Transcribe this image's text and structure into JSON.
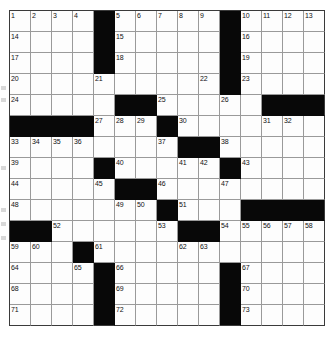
{
  "puzzle": {
    "title": "Crossword Grid",
    "size": {
      "rows": 15,
      "cols": 15
    },
    "colors": {
      "block": "#080808",
      "cell": "#fdfdfd",
      "grid_line": "#9a9a9a",
      "border": "#3a3a3a",
      "number_text": "#111111"
    },
    "cell_px": 21,
    "max_clue_number": 73,
    "layout_note": "standard 15x15 American-style symmetric crossword, empty (unfilled) grid",
    "grid": [
      [
        "1",
        "2",
        "3",
        "4",
        "#",
        "5",
        "6",
        "7",
        "8",
        "9",
        "#",
        "10",
        "11",
        "12",
        "13"
      ],
      [
        "14",
        "",
        "",
        "",
        "#",
        "15",
        "",
        "",
        "",
        "",
        "#",
        "16",
        "",
        "",
        ""
      ],
      [
        "17",
        "",
        "",
        "",
        "#",
        "18",
        "",
        "",
        "",
        "",
        "#",
        "19",
        "",
        "",
        ""
      ],
      [
        "20",
        "",
        "",
        "",
        "21",
        "",
        "",
        "",
        "",
        "22",
        "#",
        "23",
        "",
        "",
        ""
      ],
      [
        "24",
        "",
        "",
        "",
        "",
        "#",
        "#",
        "25",
        "",
        "",
        "26",
        "",
        "#",
        "#",
        "#"
      ],
      [
        "#",
        "#",
        "#",
        "#",
        "27",
        "28",
        "29",
        "#",
        "30",
        "",
        "",
        "",
        "31",
        "32",
        ""
      ],
      [
        "33",
        "34",
        "35",
        "36",
        "",
        "",
        "",
        "37",
        "#",
        "#",
        "38",
        "",
        "",
        "",
        ""
      ],
      [
        "39",
        "",
        "",
        "",
        "#",
        "40",
        "",
        "",
        "41",
        "42",
        "#",
        "43",
        "",
        "",
        ""
      ],
      [
        "44",
        "",
        "",
        "",
        "45",
        "#",
        "#",
        "46",
        "",
        "",
        "47",
        "",
        "",
        "",
        ""
      ],
      [
        "48",
        "",
        "",
        "",
        "",
        "49",
        "50",
        "#",
        "51",
        "",
        "",
        "#",
        "#",
        "#",
        "#"
      ],
      [
        "#",
        "#",
        "52",
        "",
        "",
        "",
        "",
        "53",
        "#",
        "#",
        "54",
        "55",
        "56",
        "57",
        "58"
      ],
      [
        "59",
        "60",
        "",
        "#",
        "61",
        "",
        "",
        "",
        "62",
        "63",
        "",
        "",
        "",
        "",
        ""
      ],
      [
        "64",
        "",
        "",
        "65",
        "#",
        "66",
        "",
        "",
        "",
        "",
        "#",
        "67",
        "",
        "",
        ""
      ],
      [
        "68",
        "",
        "",
        "",
        "#",
        "69",
        "",
        "",
        "",
        "",
        "#",
        "70",
        "",
        "",
        ""
      ],
      [
        "71",
        "",
        "",
        "",
        "#",
        "72",
        "",
        "",
        "",
        "",
        "#",
        "73",
        "",
        "",
        ""
      ]
    ],
    "numbered_cells": [
      {
        "n": 1,
        "r": 0,
        "c": 0
      },
      {
        "n": 2,
        "r": 0,
        "c": 1
      },
      {
        "n": 3,
        "r": 0,
        "c": 2
      },
      {
        "n": 4,
        "r": 0,
        "c": 3
      },
      {
        "n": 5,
        "r": 0,
        "c": 5
      },
      {
        "n": 6,
        "r": 0,
        "c": 6
      },
      {
        "n": 7,
        "r": 0,
        "c": 7
      },
      {
        "n": 8,
        "r": 0,
        "c": 8
      },
      {
        "n": 9,
        "r": 0,
        "c": 9
      },
      {
        "n": 10,
        "r": 0,
        "c": 11
      },
      {
        "n": 11,
        "r": 0,
        "c": 12
      },
      {
        "n": 12,
        "r": 0,
        "c": 13
      },
      {
        "n": 13,
        "r": 0,
        "c": 14
      },
      {
        "n": 14,
        "r": 1,
        "c": 0
      },
      {
        "n": 15,
        "r": 1,
        "c": 5
      },
      {
        "n": 16,
        "r": 1,
        "c": 11
      },
      {
        "n": 17,
        "r": 2,
        "c": 0
      },
      {
        "n": 18,
        "r": 2,
        "c": 5
      },
      {
        "n": 19,
        "r": 2,
        "c": 11
      },
      {
        "n": 20,
        "r": 3,
        "c": 0
      },
      {
        "n": 21,
        "r": 3,
        "c": 4
      },
      {
        "n": 22,
        "r": 3,
        "c": 9
      },
      {
        "n": 23,
        "r": 3,
        "c": 11
      },
      {
        "n": 24,
        "r": 4,
        "c": 0
      },
      {
        "n": 25,
        "r": 4,
        "c": 7
      },
      {
        "n": 26,
        "r": 4,
        "c": 10
      },
      {
        "n": 27,
        "r": 5,
        "c": 4
      },
      {
        "n": 28,
        "r": 5,
        "c": 5
      },
      {
        "n": 29,
        "r": 5,
        "c": 6
      },
      {
        "n": 30,
        "r": 5,
        "c": 8
      },
      {
        "n": 31,
        "r": 5,
        "c": 12
      },
      {
        "n": 32,
        "r": 5,
        "c": 13
      },
      {
        "n": 33,
        "r": 6,
        "c": 0
      },
      {
        "n": 34,
        "r": 6,
        "c": 1
      },
      {
        "n": 35,
        "r": 6,
        "c": 2
      },
      {
        "n": 36,
        "r": 6,
        "c": 3
      },
      {
        "n": 37,
        "r": 6,
        "c": 7
      },
      {
        "n": 38,
        "r": 6,
        "c": 10
      },
      {
        "n": 39,
        "r": 7,
        "c": 0
      },
      {
        "n": 40,
        "r": 7,
        "c": 5
      },
      {
        "n": 41,
        "r": 7,
        "c": 8
      },
      {
        "n": 42,
        "r": 7,
        "c": 9
      },
      {
        "n": 43,
        "r": 7,
        "c": 11
      },
      {
        "n": 44,
        "r": 8,
        "c": 0
      },
      {
        "n": 45,
        "r": 8,
        "c": 4
      },
      {
        "n": 46,
        "r": 8,
        "c": 7
      },
      {
        "n": 47,
        "r": 8,
        "c": 10
      },
      {
        "n": 48,
        "r": 9,
        "c": 0
      },
      {
        "n": 49,
        "r": 9,
        "c": 5
      },
      {
        "n": 50,
        "r": 9,
        "c": 6
      },
      {
        "n": 51,
        "r": 9,
        "c": 8
      },
      {
        "n": 52,
        "r": 10,
        "c": 2
      },
      {
        "n": 53,
        "r": 10,
        "c": 7
      },
      {
        "n": 54,
        "r": 10,
        "c": 10
      },
      {
        "n": 55,
        "r": 10,
        "c": 11
      },
      {
        "n": 56,
        "r": 10,
        "c": 12
      },
      {
        "n": 57,
        "r": 10,
        "c": 13
      },
      {
        "n": 58,
        "r": 10,
        "c": 14
      },
      {
        "n": 59,
        "r": 11,
        "c": 0
      },
      {
        "n": 60,
        "r": 11,
        "c": 1
      },
      {
        "n": 61,
        "r": 11,
        "c": 4
      },
      {
        "n": 62,
        "r": 11,
        "c": 8
      },
      {
        "n": 63,
        "r": 11,
        "c": 9
      },
      {
        "n": 64,
        "r": 12,
        "c": 0
      },
      {
        "n": 65,
        "r": 12,
        "c": 3
      },
      {
        "n": 66,
        "r": 12,
        "c": 5
      },
      {
        "n": 67,
        "r": 12,
        "c": 11
      },
      {
        "n": 68,
        "r": 13,
        "c": 0
      },
      {
        "n": 69,
        "r": 13,
        "c": 5
      },
      {
        "n": 70,
        "r": 13,
        "c": 11
      },
      {
        "n": 71,
        "r": 14,
        "c": 0
      },
      {
        "n": 72,
        "r": 14,
        "c": 5
      },
      {
        "n": 73,
        "r": 14,
        "c": 11
      }
    ],
    "block_cells": [
      {
        "r": 0,
        "c": 4
      },
      {
        "r": 0,
        "c": 10
      },
      {
        "r": 1,
        "c": 4
      },
      {
        "r": 1,
        "c": 10
      },
      {
        "r": 2,
        "c": 4
      },
      {
        "r": 2,
        "c": 10
      },
      {
        "r": 3,
        "c": 10
      },
      {
        "r": 4,
        "c": 5
      },
      {
        "r": 4,
        "c": 6
      },
      {
        "r": 4,
        "c": 12
      },
      {
        "r": 4,
        "c": 13
      },
      {
        "r": 4,
        "c": 14
      },
      {
        "r": 5,
        "c": 0
      },
      {
        "r": 5,
        "c": 1
      },
      {
        "r": 5,
        "c": 2
      },
      {
        "r": 5,
        "c": 3
      },
      {
        "r": 5,
        "c": 7
      },
      {
        "r": 6,
        "c": 8
      },
      {
        "r": 6,
        "c": 9
      },
      {
        "r": 7,
        "c": 4
      },
      {
        "r": 7,
        "c": 10
      },
      {
        "r": 8,
        "c": 5
      },
      {
        "r": 8,
        "c": 6
      },
      {
        "r": 9,
        "c": 7
      },
      {
        "r": 9,
        "c": 11
      },
      {
        "r": 9,
        "c": 12
      },
      {
        "r": 9,
        "c": 13
      },
      {
        "r": 9,
        "c": 14
      },
      {
        "r": 10,
        "c": 0
      },
      {
        "r": 10,
        "c": 1
      },
      {
        "r": 10,
        "c": 8
      },
      {
        "r": 10,
        "c": 9
      },
      {
        "r": 11,
        "c": 3
      },
      {
        "r": 12,
        "c": 4
      },
      {
        "r": 12,
        "c": 10
      },
      {
        "r": 13,
        "c": 4
      },
      {
        "r": 13,
        "c": 10
      },
      {
        "r": 14,
        "c": 4
      },
      {
        "r": 14,
        "c": 10
      }
    ]
  }
}
